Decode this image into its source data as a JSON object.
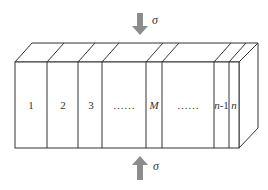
{
  "diagram": {
    "colors": {
      "stroke": "#333333",
      "arrow": "#8c8c8c",
      "background": "#ffffff"
    },
    "top_load": {
      "symbol": "σ",
      "direction": "down"
    },
    "bottom_load": {
      "symbol": "σ",
      "direction": "up"
    },
    "layers": [
      {
        "label": "1",
        "italic": false
      },
      {
        "label": "2",
        "italic": false
      },
      {
        "label": "3",
        "italic": false
      },
      {
        "label": "……",
        "italic": false
      },
      {
        "label": "M",
        "italic": true
      },
      {
        "label": "……",
        "italic": false
      },
      {
        "label_prefix": "n",
        "label_suffix": "-1",
        "italic": true
      },
      {
        "label": "n",
        "italic": true
      }
    ]
  }
}
